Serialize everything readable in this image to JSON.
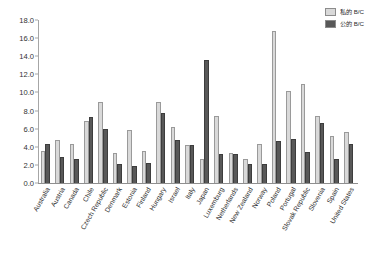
{
  "chart_data": {
    "type": "bar",
    "title": "",
    "subtitle": "",
    "xlabel": "",
    "ylabel": "",
    "ylim": [
      0.0,
      18.0
    ],
    "ytick_step": 2.0,
    "ytick_labels": [
      "18.0",
      "16.0",
      "14.0",
      "12.0",
      "10.0",
      "8.0",
      "6.0",
      "4.0",
      "2.0",
      "0.0"
    ],
    "ytick_values": [
      18.0,
      16.0,
      14.0,
      12.0,
      10.0,
      8.0,
      6.0,
      4.0,
      2.0,
      0.0
    ],
    "grid": false,
    "legend_position": "top-right",
    "orientation": "vertical",
    "categories": [
      "Australia",
      "Austria",
      "Canada",
      "Chile",
      "Czech Republic",
      "Denmark",
      "Estonia",
      "Finland",
      "Hungary",
      "Israel",
      "Italy",
      "Japan",
      "Luxemburg",
      "Netherlands",
      "New Zealand",
      "Norway",
      "Poland",
      "Portugal",
      "Slovak Republic",
      "Slovenia",
      "Spain",
      "United States"
    ],
    "series": [
      {
        "name": "私的 B/C",
        "color": "#d9d9d9",
        "values": [
          3.5,
          4.7,
          4.3,
          6.8,
          9.0,
          3.35,
          5.8,
          3.5,
          9.0,
          6.2,
          4.25,
          2.6,
          7.35,
          3.3,
          2.7,
          4.35,
          16.8,
          10.2,
          10.9,
          7.35,
          5.2,
          5.65
        ]
      },
      {
        "name": "公的 B/C",
        "color": "#585858",
        "values": [
          4.3,
          2.9,
          2.6,
          7.3,
          6.0,
          2.1,
          1.85,
          2.2,
          7.7,
          4.8,
          4.25,
          13.6,
          3.25,
          3.25,
          2.05,
          2.05,
          4.6,
          4.85,
          3.45,
          6.65,
          2.7,
          4.3
        ]
      }
    ]
  },
  "legend": {
    "items": [
      {
        "label": "私的 B/C",
        "color": "#d9d9d9"
      },
      {
        "label": "公的 B/C",
        "color": "#585858"
      }
    ]
  }
}
